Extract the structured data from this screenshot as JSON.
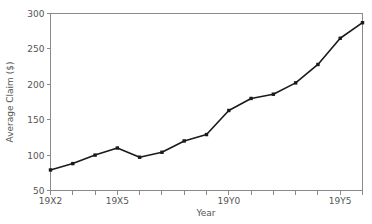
{
  "chart_data": {
    "type": "line",
    "title": "",
    "xlabel": "Year",
    "ylabel": "Average Claim ($)",
    "categories": [
      "19X2",
      "19X3",
      "19X4",
      "19X5",
      "19X6",
      "19X7",
      "19X8",
      "19X9",
      "19Y0",
      "19Y1",
      "19Y2",
      "19Y3",
      "19Y4",
      "19Y5",
      "19Y6"
    ],
    "values": [
      79,
      88,
      100,
      110,
      97,
      104,
      120,
      129,
      163,
      180,
      186,
      202,
      228,
      265,
      287
    ],
    "series": [
      {
        "name": "Average Claim",
        "values": [
          79,
          88,
          100,
          110,
          97,
          104,
          120,
          129,
          163,
          180,
          186,
          202,
          228,
          265,
          287
        ]
      }
    ],
    "x_tick_labels": [
      "19X2",
      "19X5",
      "19Y0",
      "19Y5"
    ],
    "x_tick_values": [
      "19X2",
      "19X5",
      "19Y0",
      "19Y5"
    ],
    "y_tick_labels": [
      "50",
      "100",
      "150",
      "200",
      "250",
      "300"
    ],
    "y_tick_values": [
      50,
      100,
      150,
      200,
      250,
      300
    ],
    "xlim": [
      "19X2",
      "19Y6"
    ],
    "ylim": [
      50,
      300
    ],
    "grid": false,
    "legend": false,
    "legend_position": "none",
    "marker": "square",
    "line_color": "#1a1a1a",
    "axis_color": "#8a8a8a",
    "text_color": "#555555",
    "background_color": "#ffffff"
  }
}
